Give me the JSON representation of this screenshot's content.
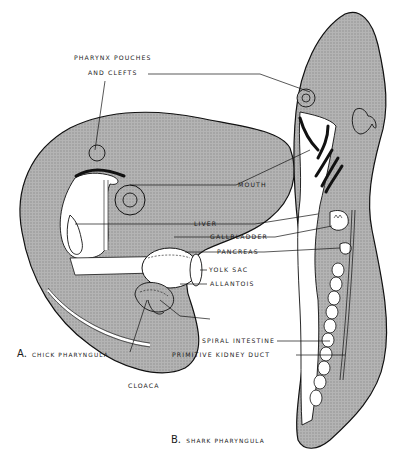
{
  "figure": {
    "panels": [
      {
        "id": "A",
        "letter": "A.",
        "caption": "CHICK PHARYNGULA"
      },
      {
        "id": "B",
        "letter": "B.",
        "caption": "SHARK PHARYNGULA"
      }
    ],
    "labels": {
      "pharynx_line1": "PHARYNX POUCHES",
      "pharynx_line2": "AND CLEFTS",
      "mouth": "MOUTH",
      "liver": "LIVER",
      "gallbladder": "GALLBLADDER",
      "pancreas": "PANCREAS",
      "yolk_sac": "YOLK SAC",
      "allantois": "ALLANTOIS",
      "spiral_intestine": "SPIRAL INTESTINE",
      "primitive_kidney_duct": "PRIMITIVE KIDNEY DUCT",
      "cloaca": "CLOACA"
    },
    "colors": {
      "tissue": "#a8a8a8",
      "outline": "#111111",
      "background": "#ffffff",
      "organ_fill": "#ffffff"
    }
  }
}
